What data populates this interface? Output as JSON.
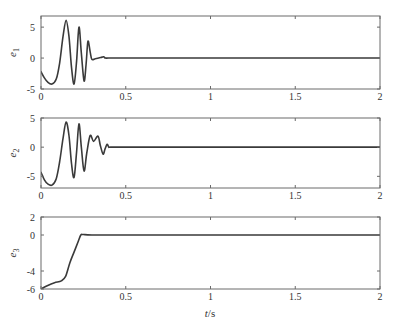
{
  "figure": {
    "xlabel_italic": "t",
    "xlabel_unit": "/s"
  },
  "chart_data": [
    {
      "type": "line",
      "title": "",
      "ylabel": "e1",
      "ylabel_base": "e",
      "ylabel_sub": "1",
      "xlabel": "",
      "xlim": [
        0,
        2
      ],
      "ylim": [
        -5,
        6.8
      ],
      "xticks": [
        0,
        0.5,
        1,
        1.5,
        2
      ],
      "xtick_labels": [
        "0",
        "0.5",
        "1",
        "1.5",
        "2"
      ],
      "yticks": [
        -5,
        0,
        5
      ],
      "ytick_labels": [
        "-5",
        "0",
        "5"
      ],
      "grid": false,
      "series": [
        {
          "name": "e1",
          "x": [
            0,
            0.02,
            0.04,
            0.065,
            0.09,
            0.11,
            0.13,
            0.148,
            0.165,
            0.18,
            0.195,
            0.21,
            0.224,
            0.238,
            0.254,
            0.266,
            0.277,
            0.29,
            0.3,
            0.32,
            0.34,
            0.36,
            0.37,
            0.38,
            0.4,
            0.5,
            1.0,
            1.5,
            2.0
          ],
          "y": [
            -2.2,
            -3.2,
            -3.9,
            -4.2,
            -3.4,
            -0.8,
            3.5,
            6.1,
            3.5,
            -1.5,
            -4.2,
            -0.5,
            5.0,
            0.8,
            -3.7,
            -1.0,
            2.7,
            1.0,
            -0.2,
            -0.1,
            0.0,
            0.15,
            0.2,
            0.0,
            0.0,
            0.0,
            0.0,
            0.0,
            0.0
          ]
        }
      ]
    },
    {
      "type": "line",
      "title": "",
      "ylabel": "e2",
      "ylabel_base": "e",
      "ylabel_sub": "2",
      "xlabel": "",
      "xlim": [
        0,
        2
      ],
      "ylim": [
        -7,
        5
      ],
      "xticks": [
        0,
        0.5,
        1,
        1.5,
        2
      ],
      "xtick_labels": [
        "0",
        "0.5",
        "1",
        "1.5",
        "2"
      ],
      "yticks": [
        -5,
        0,
        5
      ],
      "ytick_labels": [
        "-5",
        "0",
        "5"
      ],
      "grid": false,
      "series": [
        {
          "name": "e2",
          "x": [
            0,
            0.02,
            0.04,
            0.065,
            0.09,
            0.11,
            0.13,
            0.148,
            0.165,
            0.18,
            0.195,
            0.21,
            0.224,
            0.238,
            0.254,
            0.27,
            0.29,
            0.31,
            0.336,
            0.35,
            0.366,
            0.378,
            0.39,
            0.4,
            0.41,
            0.5,
            1.0,
            1.5,
            2.0
          ],
          "y": [
            -4.3,
            -5.6,
            -6.3,
            -6.5,
            -5.4,
            -2.5,
            1.5,
            4.3,
            2.0,
            -2.8,
            -5.2,
            -0.8,
            4.0,
            0.0,
            -4.1,
            -1.0,
            2.0,
            1.0,
            1.9,
            0.3,
            -1.2,
            -0.3,
            0.5,
            0.0,
            0.0,
            0.0,
            0.0,
            0.0,
            0.0
          ]
        }
      ]
    },
    {
      "type": "line",
      "title": "",
      "ylabel": "e3",
      "ylabel_base": "e",
      "ylabel_sub": "3",
      "xlabel": "t/s",
      "xlim": [
        0,
        2
      ],
      "ylim": [
        -6,
        2
      ],
      "xticks": [
        0,
        0.5,
        1,
        1.5,
        2
      ],
      "xtick_labels": [
        "0",
        "0.5",
        "1",
        "1.5",
        "2"
      ],
      "yticks": [
        -6,
        -4,
        0,
        2
      ],
      "ytick_labels": [
        "-6",
        "-4",
        "0",
        "2"
      ],
      "grid": false,
      "series": [
        {
          "name": "e3",
          "x": [
            0,
            0.04,
            0.08,
            0.12,
            0.145,
            0.17,
            0.195,
            0.22,
            0.235,
            0.25,
            0.3,
            0.5,
            1.0,
            1.5,
            2.0
          ],
          "y": [
            -6.0,
            -5.6,
            -5.3,
            -5.1,
            -4.6,
            -3.1,
            -1.9,
            -0.7,
            0.0,
            0.05,
            0.0,
            0.0,
            0.0,
            0.0,
            0.0
          ]
        }
      ]
    }
  ]
}
